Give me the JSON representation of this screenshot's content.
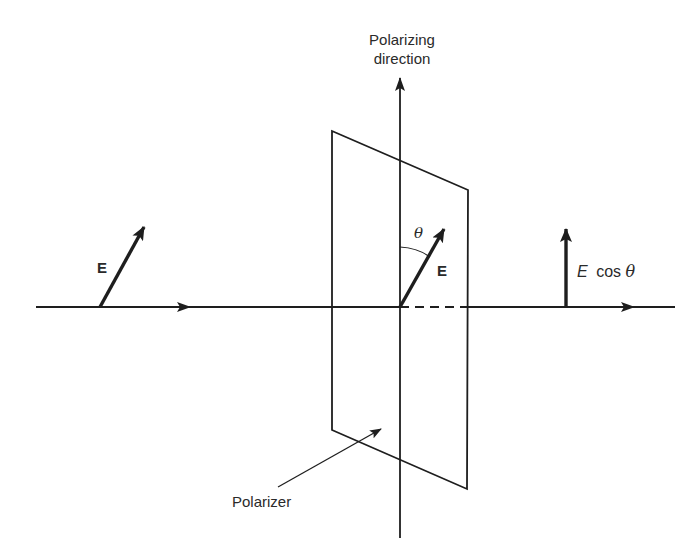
{
  "diagram": {
    "labels": {
      "polarizing_direction_line1": "Polarizing",
      "polarizing_direction_line2": "direction",
      "incident_field": "E",
      "field_at_polarizer": "E",
      "angle": "θ",
      "transmitted_E": "E",
      "transmitted_cos": "cos",
      "transmitted_theta": "θ",
      "polarizer": "Polarizer"
    },
    "colors": {
      "ink": "#1e1e1e",
      "background": "#ffffff"
    },
    "geometry": {
      "propagation_axis": {
        "x1": 36,
        "y": 307,
        "x2": 675
      },
      "polarizing_axis": {
        "x": 400,
        "y_top": 78,
        "y_bottom": 538
      },
      "polarizer_plate": [
        [
          332,
          131
        ],
        [
          468,
          190
        ],
        [
          467,
          489
        ],
        [
          332,
          430
        ]
      ],
      "incident_vector": {
        "base": [
          100,
          307
        ],
        "tip": [
          144,
          227
        ]
      },
      "field_vector_at_polarizer": {
        "base": [
          400,
          307
        ],
        "tip": [
          444,
          229
        ]
      },
      "transmitted_vector": {
        "base": [
          566,
          307
        ],
        "tip": [
          566,
          229
        ]
      },
      "polarizer_pointer": {
        "from": [
          278,
          487
        ],
        "to": [
          380,
          430
        ]
      }
    }
  }
}
